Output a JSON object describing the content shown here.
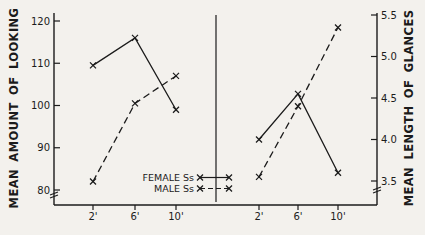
{
  "figure": {
    "background": "#f3f1ed",
    "ink": "#1b1b1b"
  },
  "chart_data": {
    "type": "line",
    "categories": [
      "2'",
      "6'",
      "10'"
    ],
    "marker": "x",
    "left_axis": {
      "label": "MEAN AMOUNT OF LOOKING",
      "ticks": [
        "120",
        "110",
        "100",
        "90",
        "80"
      ],
      "ylim": [
        80,
        120
      ],
      "axis_break": true
    },
    "right_axis": {
      "label": "MEAN LENGTH OF GLANCES",
      "ticks": [
        "5.5",
        "5.0",
        "4.5",
        "4.0",
        "3.5"
      ],
      "ylim": [
        3.5,
        5.5
      ],
      "axis_break": true
    },
    "panels": [
      {
        "name": "mean-amount-of-looking",
        "axis": "left",
        "series": [
          {
            "name": "FEMALE Ss",
            "style": "solid",
            "values": [
              109.5,
              116,
              99
            ]
          },
          {
            "name": "MALE Ss",
            "style": "dashed",
            "values": [
              82,
              100.5,
              107
            ]
          }
        ]
      },
      {
        "name": "mean-length-of-glances",
        "axis": "right",
        "series": [
          {
            "name": "FEMALE Ss",
            "style": "solid",
            "values": [
              4.0,
              4.55,
              3.6
            ]
          },
          {
            "name": "MALE Ss",
            "style": "dashed",
            "values": [
              3.55,
              4.4,
              5.35
            ]
          }
        ]
      }
    ],
    "legend": [
      {
        "label": "FEMALE Ss",
        "style": "solid"
      },
      {
        "label": "MALE Ss",
        "style": "dashed"
      }
    ],
    "grid": false,
    "legend_position": "bottom-center-left-panel"
  }
}
